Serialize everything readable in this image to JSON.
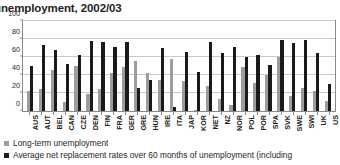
{
  "chart": {
    "title": "unemployment, 2002/03"
  },
  "legend": {
    "position": "below",
    "items": [
      {
        "swatch": "lt",
        "label": "Long-term unemployment"
      },
      {
        "swatch": "nrr",
        "label": "Average net replacement rates over 60 months of unemployment (including"
      }
    ]
  },
  "colors": {
    "long_term_unemployment": "#9d9d9d",
    "net_replacement_rate": "#1a1a1a",
    "gridline": "#c9c9c9",
    "axis": "#8a8a8a",
    "text": "#231f20",
    "background": "#ffffff"
  },
  "chart_data": {
    "type": "bar",
    "title": "unemployment, 2002/03",
    "xlabel": "",
    "ylabel": "",
    "ylim": [
      0,
      100
    ],
    "yticks": [
      0,
      20,
      40,
      60,
      80,
      100
    ],
    "grid": true,
    "legend_position": "below",
    "categories": [
      "AUS",
      "AUT",
      "BEL",
      "CAN",
      "CZE",
      "DEN",
      "FIN",
      "FRA",
      "GER",
      "GRE",
      "HUN",
      "IRE",
      "ITA",
      "JAP",
      "KOR",
      "NET",
      "NZ",
      "NOR",
      "POL",
      "POR",
      "SPA",
      "SVK",
      "SWE",
      "SWI",
      "UK",
      "US"
    ],
    "series": [
      {
        "name": "Long-term unemployment",
        "color": "#9d9d9d",
        "values": [
          22,
          24,
          46,
          10,
          50,
          19,
          24,
          42,
          49,
          56,
          42,
          35,
          58,
          33,
          1,
          28,
          13,
          7,
          49,
          31,
          40,
          60,
          17,
          26,
          22,
          11
        ]
      },
      {
        "name": "Average net replacement rates over 60 months of unemployment (including",
        "color": "#1a1a1a",
        "values": [
          50,
          73,
          68,
          52,
          62,
          78,
          77,
          71,
          77,
          26,
          35,
          70,
          5,
          66,
          43,
          77,
          64,
          71,
          60,
          62,
          51,
          79,
          76,
          79,
          65,
          30
        ]
      }
    ]
  }
}
